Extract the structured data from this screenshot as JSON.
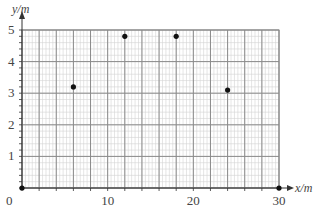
{
  "chart_data": {
    "type": "scatter",
    "title": "",
    "xlabel": "x/m",
    "ylabel": "y/m",
    "xlim": [
      0,
      30
    ],
    "ylim": [
      0,
      5
    ],
    "grid": {
      "on": true,
      "x_major_step": 2,
      "x_minor_step": 0.4,
      "y_major_step": 1,
      "y_minor_step": 0.2
    },
    "x_ticks": [
      0,
      10,
      20,
      30
    ],
    "y_ticks": [
      1,
      2,
      3,
      4,
      5
    ],
    "x_tick_labels": [
      "0",
      "10",
      "20",
      "30"
    ],
    "y_tick_labels": [
      "1",
      "2",
      "3",
      "4",
      "5"
    ],
    "legend": null,
    "series": [
      {
        "name": "points",
        "x": [
          0,
          6,
          12,
          18,
          24,
          30
        ],
        "y": [
          0,
          3.2,
          4.8,
          4.8,
          3.1,
          0
        ]
      }
    ]
  },
  "colors": {
    "major_grid": "#8a8a8a",
    "minor_grid": "#d4d4d4",
    "axis": "#333333",
    "point": "#111111",
    "text": "#444444"
  }
}
